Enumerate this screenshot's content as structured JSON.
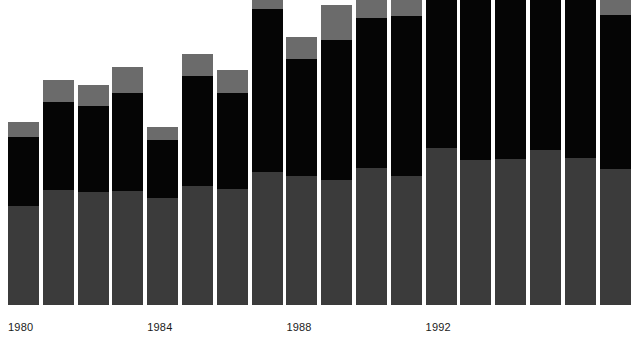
{
  "chart_data": {
    "type": "bar",
    "subtype": "stacked-bar",
    "title": "",
    "subtitle": "",
    "xlabel": "",
    "ylabel": "",
    "grid": false,
    "legend": "none",
    "axis_range_note": "y-axis unlabeled; several tall bars are clipped by the top edge of the figure",
    "ylim": [
      0,
      330
    ],
    "baseline_y_px": 305,
    "categories": [
      "1980",
      "1981",
      "1982",
      "1983",
      "1984",
      "1985",
      "1986",
      "1987",
      "1988",
      "1989",
      "1990",
      "1991",
      "1992",
      "1993",
      "1994",
      "1995",
      "1996",
      "1997"
    ],
    "tick_labels": [
      "1980",
      "1984",
      "1988",
      "1992"
    ],
    "tick_label_categories": [
      "1980",
      "1984",
      "1988",
      "1992"
    ],
    "series": [
      {
        "name": "bottom-segment",
        "color": "#3b3b3b",
        "values": [
          99,
          115,
          113,
          114,
          107,
          119,
          116,
          133,
          129,
          125,
          137,
          129,
          157,
          145,
          146,
          155,
          147,
          136
        ]
      },
      {
        "name": "middle-segment",
        "color": "#050505",
        "values": [
          69,
          88,
          86,
          98,
          58,
          110,
          96,
          163,
          117,
          140,
          150,
          160,
          182,
          196,
          212,
          209,
          214,
          154
        ]
      },
      {
        "name": "top-segment",
        "color": "#6b6b6b",
        "values": [
          15,
          22,
          21,
          26,
          13,
          22,
          23,
          32,
          22,
          35,
          31,
          32,
          31,
          45,
          10,
          8,
          8,
          67
        ]
      }
    ],
    "totals": [
      183,
      225,
      220,
      238,
      178,
      251,
      235,
      328,
      268,
      300,
      318,
      321,
      370,
      386,
      368,
      372,
      369,
      357
    ],
    "colors": {
      "bottom": "#3b3b3b",
      "middle": "#050505",
      "top": "#6b6b6b",
      "background": "#ffffff",
      "label_text": "#1a1a1a"
    }
  },
  "axis": {
    "ticks": [
      {
        "label": "1980",
        "bar_index": 0
      },
      {
        "label": "1984",
        "bar_index": 4
      },
      {
        "label": "1988",
        "bar_index": 8
      },
      {
        "label": "1992",
        "bar_index": 12
      }
    ]
  },
  "layout": {
    "bar_width_px": 31,
    "bar_pitch_px": 34.8,
    "first_bar_left_px": 8,
    "plot_height_px": 305
  }
}
